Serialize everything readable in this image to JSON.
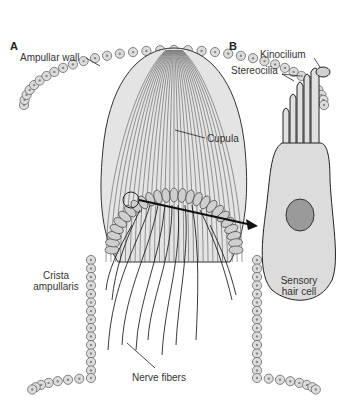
{
  "figure": {
    "panels": {
      "a": "A",
      "b": "B"
    },
    "labels": {
      "ampullar_wall": "Ampullar wall",
      "cupula": "Cupula",
      "crista_line1": "Crista",
      "crista_line2": "ampullaris",
      "nerve_fibers": "Nerve fibers",
      "kinocilium": "Kinocilium",
      "stereocilia": "Stereocilia",
      "hair_cell_line1": "Sensory",
      "hair_cell_line2": "hair cell"
    },
    "colors": {
      "cell_fill": "#dcdcdc",
      "cell_stroke": "#555555",
      "nucleus_fill": "#9a9a9a",
      "line": "#222222",
      "cupula_fill": "#e8e8e8"
    }
  }
}
